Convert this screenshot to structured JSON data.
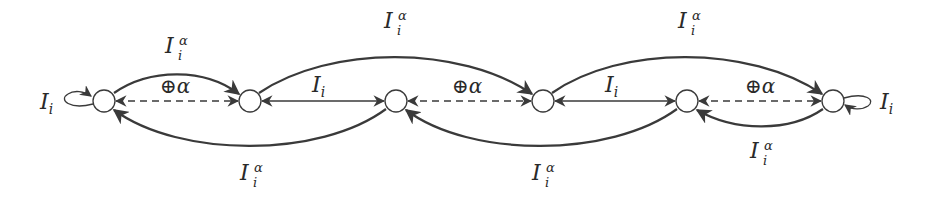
{
  "diagram": {
    "type": "state-transition-graph",
    "node_count": 6,
    "nodes": [
      {
        "id": "n1",
        "x": 104,
        "y": 101
      },
      {
        "id": "n2",
        "x": 250,
        "y": 101
      },
      {
        "id": "n3",
        "x": 396,
        "y": 101
      },
      {
        "id": "n4",
        "x": 543,
        "y": 101
      },
      {
        "id": "n5",
        "x": 687,
        "y": 101
      },
      {
        "id": "n6",
        "x": 833,
        "y": 101
      }
    ],
    "labels": {
      "self_loop_left": {
        "base": "I",
        "sub": "i"
      },
      "self_loop_right": {
        "base": "I",
        "sub": "i"
      },
      "upper_arc_1_2": {
        "base": "I",
        "sub": "i",
        "sup": "α"
      },
      "upper_arc_2_4": {
        "base": "I",
        "sub": "i",
        "sup": "α"
      },
      "upper_arc_4_6": {
        "base": "I",
        "sub": "i",
        "sup": "α"
      },
      "lower_arc_3_1": {
        "base": "I",
        "sub": "i",
        "sup": "α"
      },
      "lower_arc_5_3": {
        "base": "I",
        "sub": "i",
        "sup": "α"
      },
      "lower_arc_6_5": {
        "base": "I",
        "sub": "i",
        "sup": "α"
      },
      "straight_2_3": {
        "base": "I",
        "sub": "i"
      },
      "straight_4_5": {
        "base": "I",
        "sub": "i"
      },
      "dashed_1_2": {
        "op": "⊕",
        "sym": "α"
      },
      "dashed_3_4": {
        "op": "⊕",
        "sym": "α"
      },
      "dashed_5_6": {
        "op": "⊕",
        "sym": "α"
      }
    },
    "edges": [
      {
        "from": "n1",
        "to": "n1",
        "style": "loop",
        "label": "I_i"
      },
      {
        "from": "n6",
        "to": "n6",
        "style": "loop",
        "label": "I_i"
      },
      {
        "from": "n1",
        "to": "n2",
        "style": "solid-arc-upper",
        "label": "I_i^α"
      },
      {
        "from": "n2",
        "to": "n4",
        "style": "solid-arc-upper",
        "label": "I_i^α"
      },
      {
        "from": "n4",
        "to": "n6",
        "style": "solid-arc-upper",
        "label": "I_i^α"
      },
      {
        "from": "n3",
        "to": "n1",
        "style": "solid-arc-lower",
        "label": "I_i^α"
      },
      {
        "from": "n5",
        "to": "n3",
        "style": "solid-arc-lower",
        "label": "I_i^α"
      },
      {
        "from": "n6",
        "to": "n5",
        "style": "solid-arc-lower",
        "label": "I_i^α"
      },
      {
        "from": "n2",
        "to": "n3",
        "style": "bidirectional-solid",
        "label": "I_i"
      },
      {
        "from": "n4",
        "to": "n5",
        "style": "bidirectional-solid",
        "label": "I_i"
      },
      {
        "from": "n1",
        "to": "n2",
        "style": "bidirectional-dashed",
        "label": "⊕α"
      },
      {
        "from": "n3",
        "to": "n4",
        "style": "bidirectional-dashed",
        "label": "⊕α"
      },
      {
        "from": "n5",
        "to": "n6",
        "style": "bidirectional-dashed",
        "label": "⊕α"
      }
    ],
    "colors": {
      "stroke": "#3a3a3a",
      "text": "#2a2a2a",
      "background": "#ffffff"
    }
  }
}
